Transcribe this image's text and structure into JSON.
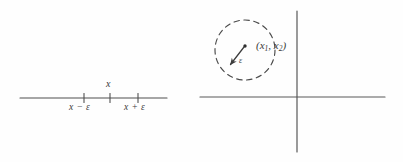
{
  "figure": {
    "background_color": "#fefefe",
    "stroke_color": "#4a4a4a",
    "text_color": "#3a3a3a",
    "panels": [
      {
        "id": "one-dimensional-neighborhood",
        "description": "Number line with epsilon neighborhood of x",
        "labels": {
          "center": "x",
          "left_endpoint": "x − ε",
          "right_endpoint": "x + ε"
        },
        "geometry": {
          "line_y": 98,
          "line_x_start": 20,
          "line_x_end": 167,
          "tick_left_x": 84,
          "tick_center_x": 110,
          "tick_right_x": 138,
          "tick_half_height": 4
        }
      },
      {
        "id": "two-dimensional-neighborhood",
        "description": "Coordinate axes with dashed circle of radius epsilon around a point",
        "labels": {
          "point": "(x₁, x₂)",
          "point_base": "(x",
          "point_sub1": "1",
          "point_mid": ", x",
          "point_sub2": "2",
          "point_close": ")",
          "radius": "ε"
        },
        "geometry": {
          "x_axis_y": 97,
          "x_axis_start": 200,
          "x_axis_end": 385,
          "y_axis_x": 297,
          "y_axis_start": 11,
          "y_axis_end": 152,
          "circle_center_x": 245,
          "circle_center_y": 50,
          "circle_radius": 30,
          "dot_x": 245,
          "dot_y": 46,
          "arrow_tip_x": 228,
          "arrow_tip_y": 66
        }
      }
    ]
  }
}
